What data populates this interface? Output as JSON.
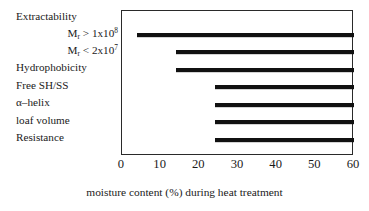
{
  "chart_data": {
    "type": "bar",
    "orientation": "horizontal",
    "title": "",
    "xlabel": "moisture content (%) during heat treatment",
    "ylabel": "",
    "xlim": [
      0,
      60
    ],
    "xticks": [
      0,
      10,
      20,
      30,
      40,
      50,
      60
    ],
    "xtick_labels": [
      "0",
      "10",
      "20",
      "30",
      "40",
      "50",
      "60"
    ],
    "grid": false,
    "legend": false,
    "bar_color": "#111111",
    "frame_color": "#2a2a2a",
    "categories": [
      "Extractability",
      "Mr > 1x10^8",
      "Mr < 2x10^7",
      "Hydrophobicity",
      "Free SH/SS",
      "α–helix",
      "loaf volume",
      "Resistance"
    ],
    "bars": [
      {
        "label": "Extractability",
        "start": 4,
        "end": 60
      },
      {
        "label": "Mr > 1x10^8",
        "start": 14,
        "end": 60
      },
      {
        "label": "Mr < 2x10^7",
        "start": 14,
        "end": 60
      },
      {
        "label": "Hydrophobicity",
        "start": 24,
        "end": 60
      },
      {
        "label": "Free SH/SS",
        "start": 24,
        "end": 60
      },
      {
        "label": "loaf volume",
        "start": 24,
        "end": 60
      },
      {
        "label": "Resistance",
        "start": 24,
        "end": 60
      }
    ]
  },
  "labels": [
    {
      "kind": "plain",
      "text": "Extractability"
    },
    {
      "kind": "indent",
      "prefix": "M",
      "sub": "r",
      "mid": " > 1x10",
      "sup": "8"
    },
    {
      "kind": "indent",
      "prefix": "M",
      "sub": "r",
      "mid": " < 2x10",
      "sup": "7"
    },
    {
      "kind": "plain",
      "text": "Hydrophobicity"
    },
    {
      "kind": "plain",
      "text": "Free SH/SS"
    },
    {
      "kind": "plain",
      "text": "α–helix"
    },
    {
      "kind": "plain",
      "text": "loaf volume"
    },
    {
      "kind": "plain",
      "text": "Resistance"
    }
  ],
  "caption": "moisture content (%) during heat treatment"
}
